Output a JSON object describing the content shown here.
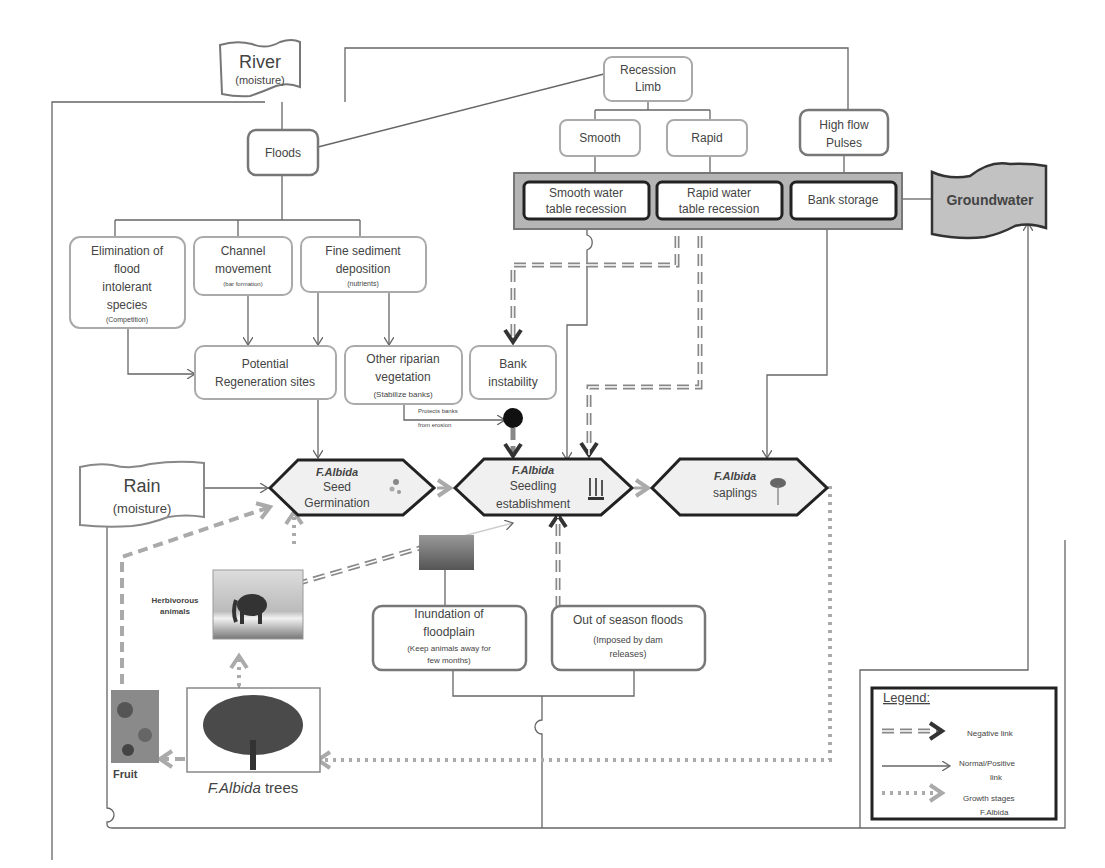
{
  "nodes": {
    "river": {
      "title": "River",
      "sub": "(moisture)"
    },
    "floods": {
      "label": "Floods"
    },
    "recession": {
      "line1": "Recession",
      "line2": "Limb"
    },
    "smooth": {
      "label": "Smooth"
    },
    "rapid": {
      "label": "Rapid"
    },
    "high_flow": {
      "line1": "High flow",
      "line2": "Pulses"
    },
    "smooth_table": {
      "line1": "Smooth water",
      "line2": "table recession"
    },
    "rapid_table": {
      "line1": "Rapid water",
      "line2": "table recession"
    },
    "bank_storage": {
      "label": "Bank storage"
    },
    "groundwater": {
      "label": "Groundwater"
    },
    "elimination": {
      "line1": "Elimination of",
      "line2": "flood",
      "line3": "intolerant",
      "line4": "species",
      "sub": "(Competition)"
    },
    "channel": {
      "line1": "Channel",
      "line2": "movement",
      "sub": "(bar formation)"
    },
    "fine_sediment": {
      "line1": "Fine sediment",
      "line2": "deposition",
      "sub": "(nutrients)"
    },
    "potential": {
      "line1": "Potential",
      "line2": "Regeneration sites"
    },
    "other_riparian": {
      "line1": "Other riparian",
      "line2": "vegetation",
      "sub": "(Stabilize banks)"
    },
    "bank_instability": {
      "line1": "Bank",
      "line2": "instability"
    },
    "protects": {
      "line1": "Protects banks",
      "line2": "from erosion"
    },
    "rain": {
      "title": "Rain",
      "sub": "(moisture)"
    },
    "seed_germ": {
      "species": "F.Albida",
      "line1": "Seed",
      "line2": "Germination"
    },
    "seedling": {
      "species": "F.Albida",
      "line1": "Seedling",
      "line2": "establishment"
    },
    "saplings": {
      "species": "F.Albida",
      "line1": "saplings"
    },
    "herbivorous": {
      "line1": "Herbivorous",
      "line2": "animals"
    },
    "inundation": {
      "line1": "Inundation of",
      "line2": "floodplain",
      "sub1": "(Keep animals away for",
      "sub2": "few months)"
    },
    "out_of_season": {
      "line1": "Out of season floods",
      "sub1": "(Imposed by dam",
      "sub2": "releases)"
    },
    "fruit": {
      "label": "Fruit"
    },
    "trees": {
      "species": "F.Albida",
      "suffix": " trees"
    }
  },
  "legend": {
    "title": "Legend:",
    "items": [
      {
        "label1": "Negative link",
        "label2": ""
      },
      {
        "label1": "Normal/Positive",
        "label2": "link"
      },
      {
        "label1": "Growth stages",
        "label2": "F.Albida"
      }
    ]
  },
  "colors": {
    "storage_fill": "#b5b5b5",
    "groundwater_fill": "#c2c2c2",
    "hexagon_fill": "#f0f0f0"
  }
}
